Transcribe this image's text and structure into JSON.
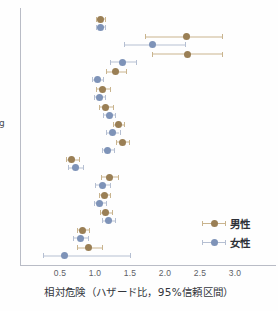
{
  "chart_data": {
    "type": "scatter",
    "title": "",
    "xlabel": "相対危険（ハザード比，95%信頼区間）",
    "ylabel": "g",
    "xlim": [
      0.2,
      3.4
    ],
    "xticks": [
      0.5,
      1.0,
      1.5,
      2.0,
      2.5,
      3.0
    ],
    "xticklabels": [
      "0.5",
      "1.0",
      "1.5",
      "2.0",
      "2.5",
      "3.0"
    ],
    "grid": false,
    "legend_position": "bottom-right",
    "legend": [
      "男性",
      "女性"
    ],
    "colors": {
      "male_point": "#9a7f55",
      "male_ci": "#c9b48e",
      "female_point": "#7e93b8",
      "female_ci": "#b5bfd2",
      "axis": "#b9bcc6",
      "text": "#33363c"
    },
    "series": [
      {
        "name": "男性",
        "color": "#9a7f55",
        "values": [
          1.08,
          2.3,
          2.32,
          1.29,
          1.11,
          1.15,
          1.33,
          1.39,
          0.67,
          1.2,
          1.13,
          1.15,
          0.82,
          0.91
        ],
        "ci_low": [
          1.02,
          1.72,
          1.82,
          1.15,
          1.02,
          1.05,
          1.25,
          1.3,
          0.58,
          1.08,
          1.05,
          1.07,
          0.74,
          0.74
        ],
        "ci_high": [
          1.14,
          2.82,
          2.82,
          1.44,
          1.22,
          1.25,
          1.42,
          1.48,
          0.77,
          1.33,
          1.22,
          1.24,
          0.91,
          1.1
        ]
      },
      {
        "name": "女性",
        "color": "#7e93b8",
        "values": [
          1.08,
          1.82,
          1.39,
          1.04,
          1.06,
          1.2,
          1.25,
          1.18,
          0.72,
          1.1,
          1.07,
          1.19,
          0.79,
          0.56
        ],
        "ci_low": [
          1.02,
          1.42,
          1.22,
          0.96,
          0.98,
          1.11,
          1.16,
          1.1,
          0.62,
          1.0,
          0.99,
          1.1,
          0.68,
          0.25
        ],
        "ci_high": [
          1.14,
          2.28,
          1.58,
          1.12,
          1.14,
          1.29,
          1.35,
          1.27,
          0.83,
          1.21,
          1.16,
          1.29,
          0.9,
          1.5
        ]
      }
    ],
    "n_rows": 14
  }
}
